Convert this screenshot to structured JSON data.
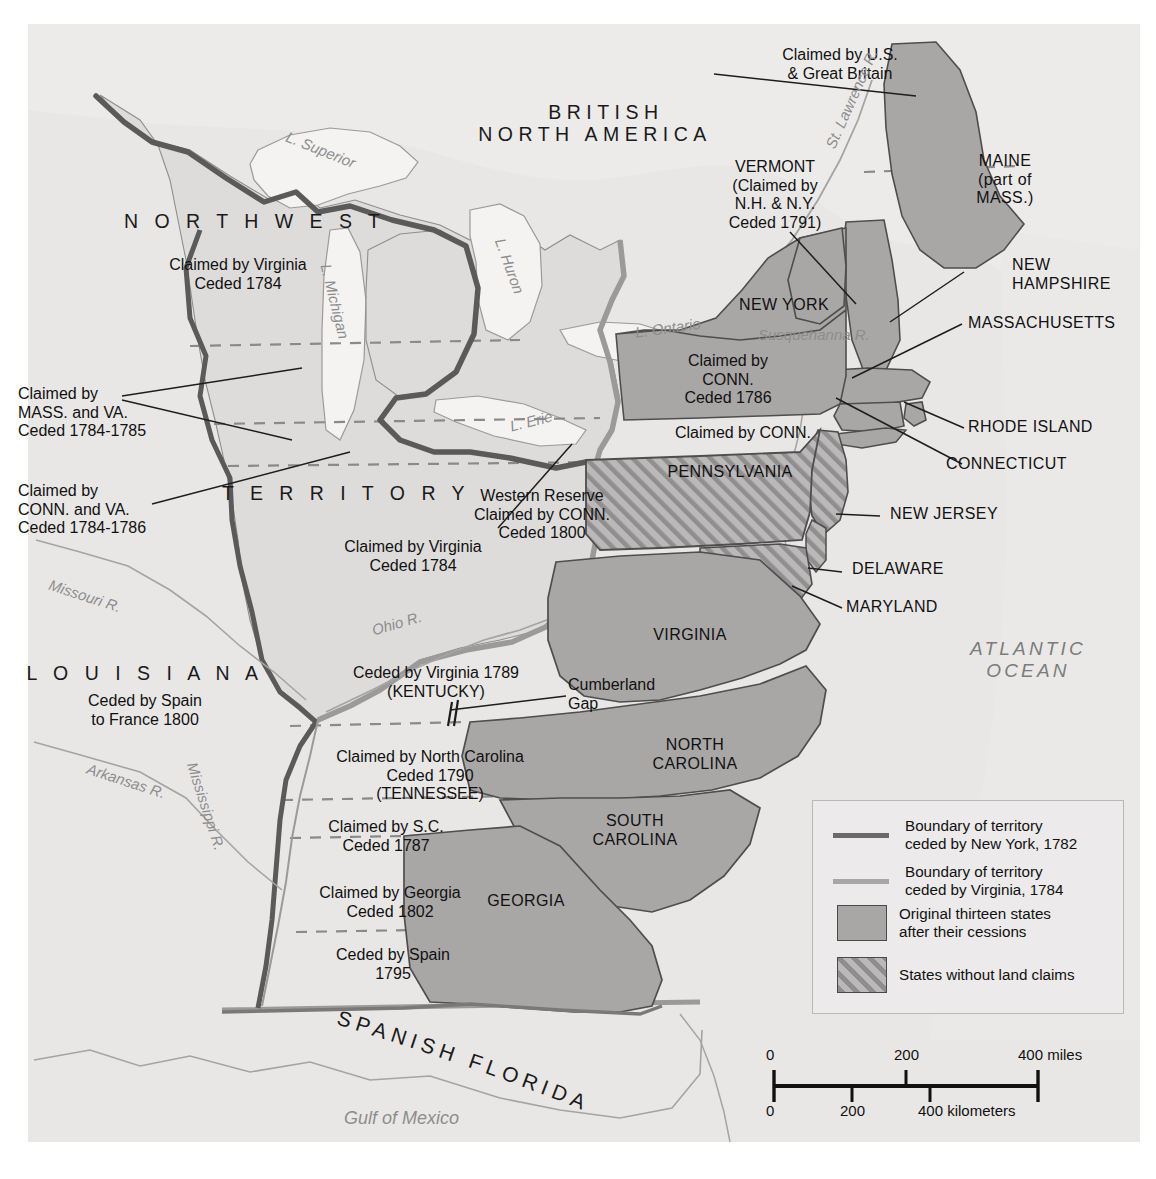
{
  "map": {
    "title_regions": {
      "british_north_america": "BRITISH\nNORTH AMERICA",
      "northwest": "N O R T H W E S T",
      "territory": "T E R R I T O R Y",
      "louisiana": "L O U I S I A N A",
      "spanish_florida": "SPANISH FLORIDA",
      "atlantic_ocean": "ATLANTIC\nOCEAN"
    },
    "annotations": [
      {
        "id": "claimed-us-gb",
        "text": "Claimed by U.S.\n& Great Britain"
      },
      {
        "id": "vermont",
        "text": "VERMONT\n(Claimed by\nN.H. & N.Y.\nCeded 1791)"
      },
      {
        "id": "claimed-virginia-nw",
        "text": "Claimed by Virginia\nCeded 1784"
      },
      {
        "id": "claimed-mass-va",
        "text": "Claimed by\nMASS. and VA.\nCeded 1784-1785"
      },
      {
        "id": "claimed-conn-va",
        "text": "Claimed by\nCONN. and VA.\nCeded 1784-1786"
      },
      {
        "id": "claimed-virginia-terr",
        "text": "Claimed by Virginia\nCeded 1784"
      },
      {
        "id": "western-reserve",
        "text": "Western Reserve\nClaimed by CONN.\nCeded 1800"
      },
      {
        "id": "claimed-conn-1786",
        "text": "Claimed by\nCONN.\nCeded 1786"
      },
      {
        "id": "claimed-conn-pa",
        "text": "Claimed by CONN."
      },
      {
        "id": "louisiana-sub",
        "text": "Ceded by Spain\nto France 1800"
      },
      {
        "id": "ceded-virginia-ky",
        "text": "Ceded by Virginia 1789\n(KENTUCKY)"
      },
      {
        "id": "cumberland-gap",
        "text": "Cumberland\nGap"
      },
      {
        "id": "claimed-nc-tn",
        "text": "Claimed by North Carolina\nCeded 1790\n(TENNESSEE)"
      },
      {
        "id": "claimed-sc",
        "text": "Claimed by S.C.\nCeded 1787"
      },
      {
        "id": "claimed-georgia",
        "text": "Claimed by Georgia\nCeded 1802"
      },
      {
        "id": "ceded-spain-1795",
        "text": "Ceded by Spain\n1795"
      }
    ],
    "states": [
      {
        "id": "maine",
        "text": "MAINE\n(part of\nMASS.)"
      },
      {
        "id": "new-hampshire",
        "text": "NEW\nHAMPSHIRE"
      },
      {
        "id": "massachusetts",
        "text": "MASSACHUSETTS"
      },
      {
        "id": "rhode-island",
        "text": "RHODE ISLAND"
      },
      {
        "id": "connecticut",
        "text": "CONNECTICUT"
      },
      {
        "id": "new-york",
        "text": "NEW YORK"
      },
      {
        "id": "pennsylvania",
        "text": "PENNSYLVANIA"
      },
      {
        "id": "new-jersey",
        "text": "NEW JERSEY"
      },
      {
        "id": "delaware",
        "text": "DELAWARE"
      },
      {
        "id": "maryland",
        "text": "MARYLAND"
      },
      {
        "id": "virginia",
        "text": "VIRGINIA"
      },
      {
        "id": "north-carolina",
        "text": "NORTH\nCAROLINA"
      },
      {
        "id": "south-carolina",
        "text": "SOUTH\nCAROLINA"
      },
      {
        "id": "georgia",
        "text": "GEORGIA"
      }
    ],
    "water_features": [
      {
        "id": "lake-superior",
        "text": "L. Superior"
      },
      {
        "id": "lake-michigan",
        "text": "L. Michigan"
      },
      {
        "id": "lake-huron",
        "text": "L. Huron"
      },
      {
        "id": "lake-erie",
        "text": "L. Erie"
      },
      {
        "id": "lake-ontario",
        "text": "L. Ontario"
      },
      {
        "id": "st-lawrence-river",
        "text": "St. Lawrence R."
      },
      {
        "id": "susquehanna-river",
        "text": "Susquehanna R."
      },
      {
        "id": "missouri-river",
        "text": "Missouri R."
      },
      {
        "id": "ohio-river",
        "text": "Ohio R."
      },
      {
        "id": "arkansas-river",
        "text": "Arkansas R."
      },
      {
        "id": "mississippi-river",
        "text": "Mississippi R."
      },
      {
        "id": "gulf-of-mexico",
        "text": "Gulf of Mexico"
      }
    ],
    "legend": {
      "items": [
        {
          "id": "boundary-ny",
          "symbol": "line-dark",
          "text": "Boundary of territory\nceded by New York, 1782"
        },
        {
          "id": "boundary-va",
          "symbol": "line-light",
          "text": "Boundary of territory\nceded by Virginia, 1784"
        },
        {
          "id": "original-states",
          "symbol": "solid-swatch",
          "text": "Original thirteen states\nafter their cessions"
        },
        {
          "id": "no-land-claims",
          "symbol": "hatch-swatch",
          "text": "States without land claims"
        }
      ]
    },
    "scale": {
      "miles_ticks": [
        "0",
        "200",
        "400 miles"
      ],
      "km_ticks": [
        "0",
        "200",
        "400 kilometers"
      ]
    },
    "colors": {
      "land": "#e2e0df",
      "state_fill": "#a9a7a6",
      "hatch_fill": "#b0aeae",
      "territory_fill": "#d6d4d3",
      "boundary_ny": "#5f5f5f",
      "boundary_va": "#9a9898",
      "water_text": "#8d8d8d",
      "ocean_text": "#7c7c7c",
      "page_bg": "#ffffff"
    }
  }
}
